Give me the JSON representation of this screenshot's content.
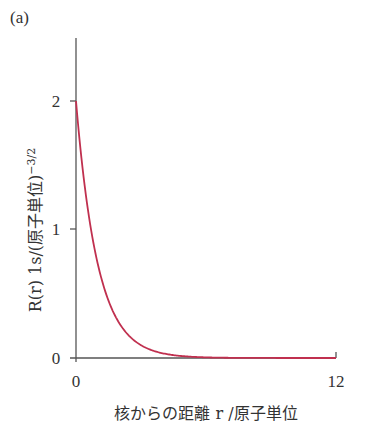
{
  "panel_label": "(a)",
  "chart_data": {
    "type": "line",
    "title": "",
    "xlabel": "核からの距離 r /原子単位",
    "ylabel": "R(r) 1s/(原子単位)",
    "ylabel_superscript": "−3/2",
    "xlim": [
      0,
      12
    ],
    "ylim": [
      0,
      2.5
    ],
    "x_ticks": [
      "0",
      "12"
    ],
    "y_ticks": [
      "0",
      "1",
      "2"
    ],
    "grid": false,
    "legend": null,
    "series": [
      {
        "name": "R(r) 1s",
        "color": "#c0304f",
        "function": "2*exp(-r)",
        "x": [
          0,
          0.5,
          1,
          1.5,
          2,
          2.5,
          3,
          3.5,
          4,
          5,
          6,
          8,
          10,
          12
        ],
        "y": [
          2.0,
          1.21,
          0.74,
          0.45,
          0.27,
          0.16,
          0.1,
          0.06,
          0.04,
          0.013,
          0.005,
          0.0007,
          0.0001,
          0.0
        ]
      }
    ]
  }
}
